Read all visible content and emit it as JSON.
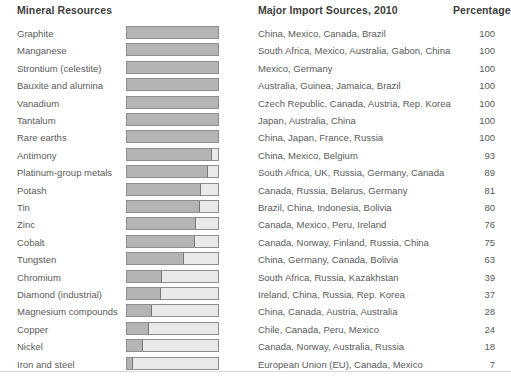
{
  "header": {
    "mineral_label": "Mineral Resources",
    "sources_label": "Major Import Sources, 2010",
    "percentage_label": "Percentage"
  },
  "colors": {
    "bar_fill": "#b4b4b4",
    "bar_track": "#e9e9e9",
    "bar_border": "#8e8e8e",
    "text": "#5a5a5a",
    "background": "#ffffff"
  },
  "chart_data": {
    "type": "bar",
    "title": "Mineral Resources",
    "xlabel": "Percentage",
    "ylabel": "Mineral Resources",
    "xlim": [
      0,
      100
    ],
    "grid": false,
    "legend": false,
    "orientation": "horizontal",
    "categories": [
      "Graphite",
      "Manganese",
      "Strontium (celestite)",
      "Bauxite and alumina",
      "Vanadium",
      "Tantalum",
      "Rare earths",
      "Antimony",
      "Platinum-group metals",
      "Potash",
      "Tin",
      "Zinc",
      "Cobalt",
      "Tungsten",
      "Chromium",
      "Diamond (industrial)",
      "Magnesium compounds",
      "Copper",
      "Nickel",
      "Iron and steel"
    ],
    "values": [
      100,
      100,
      100,
      100,
      100,
      100,
      100,
      93,
      89,
      81,
      80,
      76,
      75,
      63,
      39,
      37,
      28,
      24,
      18,
      7
    ],
    "annotations": [
      "China, Mexico, Canada, Brazil",
      "South Africa, Mexico, Australia, Gabon, China",
      "Mexico, Germany",
      "Australia, Guinea, Jamaica, Brazil",
      "Czech Republic, Canada, Austria, Rep. Korea",
      "Japan, Australia, China",
      "China, Japan, France, Russia",
      "China, Mexico, Belgium",
      "South Africa, UK, Russia, Germany, Canada",
      "Canada, Russia, Belarus, Germany",
      "Brazil, China, Indonesia, Bolivia",
      "Canada, Mexico, Peru, Ireland",
      "Canada, Norway, Finland, Russia, China",
      "China, Germany, Canada, Bolivia",
      "South Africa, Russia, Kazakhstan",
      "Ireland, China, Russia, Rep. Korea",
      "China, Canada, Austria, Australia",
      "Chile, Canada, Peru, Mexico",
      "Canada, Norway, Australia, Russia",
      "European Union (EU), Canada, Mexico"
    ]
  },
  "rows": [
    {
      "mineral": "Graphite",
      "sources": "China, Mexico, Canada, Brazil",
      "percentage": 100
    },
    {
      "mineral": "Manganese",
      "sources": "South Africa, Mexico, Australia, Gabon, China",
      "percentage": 100
    },
    {
      "mineral": "Strontium (celestite)",
      "sources": "Mexico, Germany",
      "percentage": 100
    },
    {
      "mineral": "Bauxite and alumina",
      "sources": "Australia, Guinea, Jamaica, Brazil",
      "percentage": 100
    },
    {
      "mineral": "Vanadium",
      "sources": "Czech Republic, Canada, Austria, Rep. Korea",
      "percentage": 100
    },
    {
      "mineral": "Tantalum",
      "sources": "Japan, Australia, China",
      "percentage": 100
    },
    {
      "mineral": "Rare earths",
      "sources": "China, Japan, France, Russia",
      "percentage": 100
    },
    {
      "mineral": "Antimony",
      "sources": "China, Mexico, Belgium",
      "percentage": 93
    },
    {
      "mineral": "Platinum-group metals",
      "sources": "South Africa, UK, Russia, Germany, Canada",
      "percentage": 89
    },
    {
      "mineral": "Potash",
      "sources": "Canada, Russia, Belarus, Germany",
      "percentage": 81
    },
    {
      "mineral": "Tin",
      "sources": "Brazil, China, Indonesia, Bolivia",
      "percentage": 80
    },
    {
      "mineral": "Zinc",
      "sources": "Canada, Mexico, Peru, Ireland",
      "percentage": 76
    },
    {
      "mineral": "Cobalt",
      "sources": "Canada, Norway, Finland, Russia, China",
      "percentage": 75
    },
    {
      "mineral": "Tungsten",
      "sources": "China, Germany, Canada, Bolivia",
      "percentage": 63
    },
    {
      "mineral": "Chromium",
      "sources": "South Africa, Russia, Kazakhstan",
      "percentage": 39
    },
    {
      "mineral": "Diamond (industrial)",
      "sources": "Ireland, China, Russia, Rep. Korea",
      "percentage": 37
    },
    {
      "mineral": "Magnesium compounds",
      "sources": "China, Canada, Austria, Australia",
      "percentage": 28
    },
    {
      "mineral": "Copper",
      "sources": "Chile, Canada, Peru, Mexico",
      "percentage": 24
    },
    {
      "mineral": "Nickel",
      "sources": "Canada, Norway, Australia, Russia",
      "percentage": 18
    },
    {
      "mineral": "Iron and steel",
      "sources": "European Union (EU), Canada, Mexico",
      "percentage": 7
    }
  ]
}
